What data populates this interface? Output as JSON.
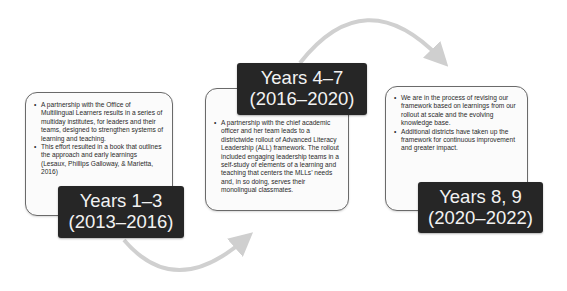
{
  "diagram": {
    "type": "timeline",
    "colors": {
      "label_bg": "#262626",
      "label_text": "#f2f2f2",
      "box_border": "#6a6a6a",
      "arrow": "#cfcfcf"
    },
    "stages": [
      {
        "label_line1": "Years 1–3",
        "label_line2": "(2013–2016)",
        "bullets": [
          "A partnership with the Office of Multilingual Learners results in a series of multiday institutes, for leaders and their teams, designed to strengthen systems of learning and teaching.",
          "This effort resulted in a book that outlines the approach and early learnings (Lesaux, Phillips Galloway, & Marietta, 2016)"
        ]
      },
      {
        "label_line1": "Years 4–7",
        "label_line2": "(2016–2020)",
        "bullets": [
          "A partnership with the chief academic officer and her team leads to a districtwide rollout of Advanced Literacy Leadership (ALL) framework. The rollout included engaging leadership teams in a self-study of elements of a learning and teaching that centers the MLLs’ needs and, in so doing, serves their monolingual classmates."
        ]
      },
      {
        "label_line1": "Years 8, 9",
        "label_line2": "(2020–2022)",
        "bullets": [
          "We are in the process of revising our framework based on learnings from our rollout at scale and the evolving knowledge base.",
          "Additional districts have taken up the framework for continuous improvement and greater impact."
        ]
      }
    ]
  }
}
